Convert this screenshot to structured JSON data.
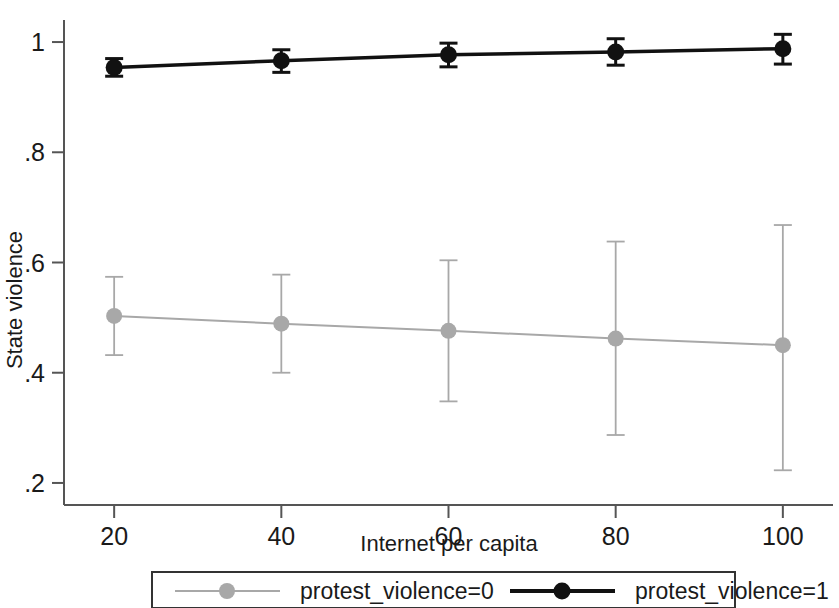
{
  "chart_data": {
    "type": "line",
    "title": "",
    "subtitle": "",
    "xlabel": "Internet per capita",
    "ylabel": "State violence",
    "x": [
      20,
      40,
      60,
      80,
      100
    ],
    "xticks": [
      "20",
      "40",
      "60",
      "80",
      "100"
    ],
    "yticks": [
      "1",
      ".8",
      ".6",
      ".4",
      ".2"
    ],
    "ytick_values": [
      1,
      0.8,
      0.6,
      0.4,
      0.2
    ],
    "xlim": [
      14,
      106
    ],
    "ylim": [
      0.16,
      1.04
    ],
    "grid": false,
    "legend_position": "below",
    "error_bars": "vertical-capped",
    "series": [
      {
        "name": "protest_violence=0",
        "color": "#a8a8a8",
        "marker": "circle",
        "values": [
          0.503,
          0.489,
          0.476,
          0.462,
          0.45
        ],
        "ci_low": [
          0.432,
          0.4,
          0.348,
          0.287,
          0.223
        ],
        "ci_high": [
          0.574,
          0.578,
          0.604,
          0.638,
          0.668
        ]
      },
      {
        "name": "protest_violence=1",
        "color": "#111111",
        "marker": "circle",
        "values": [
          0.954,
          0.966,
          0.977,
          0.982,
          0.988
        ],
        "ci_low": [
          0.938,
          0.945,
          0.955,
          0.958,
          0.96
        ],
        "ci_high": [
          0.97,
          0.986,
          0.998,
          1.006,
          1.014
        ]
      }
    ]
  },
  "axes": {
    "y_title": "State violence",
    "x_title": "Internet per capita"
  },
  "legend": {
    "entries": [
      {
        "label": "protest_violence=0",
        "color": "#a8a8a8"
      },
      {
        "label": "protest_violence=1",
        "color": "#111111"
      }
    ]
  }
}
